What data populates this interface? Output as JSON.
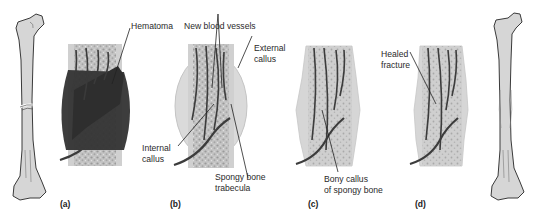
{
  "figure": {
    "colors": {
      "bone_fill": "#d4d4d4",
      "bone_outline": "#3a3a3a",
      "hematoma": "#3b3b3b",
      "spongy": "#bcbcbc",
      "cortex": "#cfcfcf",
      "callus": "#d9d9d9",
      "vessel": "#3d3d3d"
    },
    "panels": [
      {
        "id": "(a)",
        "stage": "hematoma formation"
      },
      {
        "id": "(b)",
        "stage": "callus formation"
      },
      {
        "id": "(c)",
        "stage": "bony callus"
      },
      {
        "id": "(d)",
        "stage": "healed"
      }
    ],
    "labels": {
      "hematoma": "Hematoma",
      "new_blood_vessels": "New blood vessels",
      "external_callus_1": "External",
      "external_callus_2": "callus",
      "internal_callus_1": "Internal",
      "internal_callus_2": "callus",
      "spongy_trabecula_1": "Spongy bone",
      "spongy_trabecula_2": "trabecula",
      "bony_callus_1": "Bony callus",
      "bony_callus_2": "of spongy bone",
      "healed_fracture_1": "Healed",
      "healed_fracture_2": "fracture"
    }
  }
}
